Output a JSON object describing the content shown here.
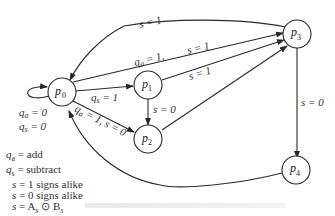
{
  "diagram": {
    "type": "state-diagram",
    "nodes": [
      {
        "id": "p0",
        "base": "p",
        "sub": "0"
      },
      {
        "id": "p1",
        "base": "p",
        "sub": "1"
      },
      {
        "id": "p2",
        "base": "p",
        "sub": "2"
      },
      {
        "id": "p3",
        "base": "p",
        "sub": "3"
      },
      {
        "id": "p4",
        "base": "p",
        "sub": "4"
      }
    ],
    "edges": [
      {
        "from": "p0",
        "to": "p0",
        "label_lines": [
          "q_a = 0",
          "q_s = 0"
        ]
      },
      {
        "from": "p0",
        "to": "p1",
        "label": "q_s = 1"
      },
      {
        "from": "p0",
        "to": "p3",
        "label": "q_a = 1, s = 1"
      },
      {
        "from": "p0",
        "to": "p2",
        "label": "q_a = 1, s = 0"
      },
      {
        "from": "p1",
        "to": "p3",
        "label": "s = 1"
      },
      {
        "from": "p1",
        "to": "p2",
        "label": "s = 0"
      },
      {
        "from": "p2",
        "to": "p3",
        "label": ""
      },
      {
        "from": "p3",
        "to": "p0",
        "label": "s = 1"
      },
      {
        "from": "p3",
        "to": "p4",
        "label": "s = 0"
      },
      {
        "from": "p4",
        "to": "p0",
        "label": ""
      }
    ],
    "labels": {
      "p0_p3_top": "s = 1",
      "p0_p3_qa": "q",
      "p0_p3_qa_sub": "a",
      "p0_p3_qa_rest": " = 1,",
      "p0_p3_s": "s = 1",
      "p1_p3": "s = 1",
      "p0_p1_q": "q",
      "p0_p1_sub": "s",
      "p0_p1_rest": " = 1",
      "p1_p2": "s = 0",
      "p0_p2_q": "q",
      "p0_p2_sub": "a",
      "p0_p2_rest": " = 1, s = 0",
      "p3_p4": "s = 0",
      "self_qa": "q",
      "self_qa_sub": "a",
      "self_qa_rest": " = 0",
      "self_qs": "q",
      "self_qs_sub": "s",
      "self_qs_rest": " = 0"
    }
  },
  "legend": [
    {
      "sym": "q",
      "sub": "a",
      "text": " = add"
    },
    {
      "sym": "q",
      "sub": "s",
      "text": " = subtract"
    },
    {
      "sym": "s",
      "sub": "",
      "text": " = 1 signs alike"
    },
    {
      "sym": "s",
      "sub": "",
      "text": " = 0 signs alike"
    },
    {
      "sym": "s",
      "sub": "",
      "text": " = A",
      "sub2": "s",
      "text2": " ⊙ B",
      "sub3": "s"
    }
  ]
}
